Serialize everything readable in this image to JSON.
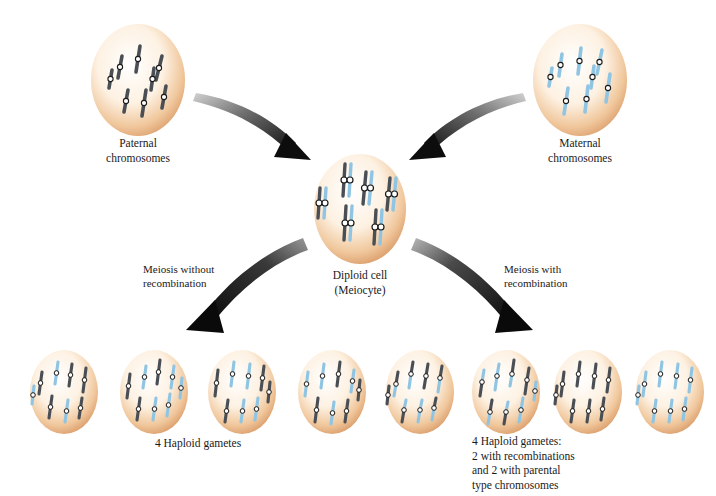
{
  "figure": {
    "background": "#ffffff"
  },
  "palette": {
    "paternal_chromosome": "#4a4f55",
    "maternal_chromosome": "#8fc4e2",
    "cell_rim": "#e0a878",
    "cell_center": "#fffdf9",
    "centromere_ring": "#1a1a1a",
    "centromere_fill": "#ffffff",
    "arrow_dark": "#111111",
    "arrow_light": "#c8c8c8",
    "text": "#1a1a1a"
  },
  "cells": {
    "paternal": {
      "label": "Paternal\nchromosomes",
      "chromosome_type": "single",
      "chromosome_count": 8,
      "color_key": "paternal_chromosome"
    },
    "maternal": {
      "label": "Maternal\nchromosomes",
      "chromosome_type": "single",
      "chromosome_count": 8,
      "color_key": "maternal_chromosome"
    },
    "diploid": {
      "label": "Diploid cell\n(Meiocyte)",
      "chromosome_type": "paired",
      "chromosome_count": 8,
      "note": "each pair has one paternal and one maternal chromatid"
    }
  },
  "pathways": {
    "left": {
      "label": "Meiosis without\nrecombination",
      "arrow_direction": "down-left"
    },
    "right": {
      "label": "Meiosis with\nrecombination",
      "arrow_direction": "down-right"
    }
  },
  "arrows": [
    {
      "name": "paternal-to-diploid",
      "from": "paternal",
      "to": "diploid",
      "direction": "down-right"
    },
    {
      "name": "maternal-to-diploid",
      "from": "maternal",
      "to": "diploid",
      "direction": "down-left"
    },
    {
      "name": "diploid-to-left-gametes",
      "from": "diploid",
      "to": "left-gametes",
      "direction": "down-left"
    },
    {
      "name": "diploid-to-right-gametes",
      "from": "diploid",
      "to": "right-gametes",
      "direction": "down-right"
    }
  ],
  "gametes": {
    "left": {
      "caption": "4 Haploid gametes",
      "count": 4,
      "cells": [
        {
          "index": 1,
          "composition": "mixed parental whole chromosomes"
        },
        {
          "index": 2,
          "composition": "mixed parental whole chromosomes"
        },
        {
          "index": 3,
          "composition": "mixed parental whole chromosomes"
        },
        {
          "index": 4,
          "composition": "mixed parental whole chromosomes"
        }
      ]
    },
    "right": {
      "caption": "4 Haploid gametes:\n2 with recombinations\nand 2 with parental\ntype chromosomes",
      "count": 4,
      "cells": [
        {
          "index": 1,
          "composition": "recombinant (two-tone chromosomes)"
        },
        {
          "index": 2,
          "composition": "recombinant (two-tone chromosomes)"
        },
        {
          "index": 3,
          "composition": "parental type (all paternal)"
        },
        {
          "index": 4,
          "composition": "parental type (all maternal)"
        }
      ]
    }
  }
}
